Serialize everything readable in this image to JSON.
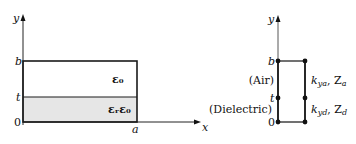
{
  "left_figure": {
    "axis_y_label": "y",
    "axis_x_label": "x",
    "tick_b": "b",
    "tick_t": "t",
    "tick_0": "0",
    "tick_a": "a",
    "region_top_label": "ε₀",
    "region_bottom_label": "εᵣε₀",
    "colors": {
      "dielectric_fill": "#e6e6e6",
      "line": "#1a1a1a"
    }
  },
  "right_figure": {
    "axis_y_label": "y",
    "tick_b": "b",
    "tick_t": "t",
    "tick_0": "0",
    "air_label": "(Air)",
    "dielectric_label": "(Dielectric)",
    "air_params": {
      "k": "k",
      "k_sub": "ya",
      "Z": "Z",
      "Z_sub": "a"
    },
    "dielectric_params": {
      "k": "k",
      "k_sub": "yd",
      "Z": "Z",
      "Z_sub": "d"
    }
  }
}
